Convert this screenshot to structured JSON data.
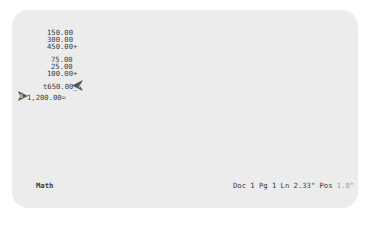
{
  "document": {
    "lines": [
      {
        "text": "150.00",
        "x": 47,
        "y": 29
      },
      {
        "text": "300.00",
        "x": 47,
        "y": 36
      },
      {
        "text": "450.00+",
        "x": 47,
        "y": 43
      },
      {
        "text": "75.00",
        "x": 51,
        "y": 56
      },
      {
        "text": "25.00",
        "x": 51,
        "y": 63
      },
      {
        "text": "100.00+",
        "x": 47,
        "y": 70
      },
      {
        "text": "t650.00_",
        "x": 43,
        "y": 83
      },
      {
        "text": "1,200.00=",
        "x": 27,
        "y": 94
      }
    ],
    "markers": [
      {
        "name": "left-pointing-arrow-icon",
        "x": 72,
        "y": 80
      },
      {
        "name": "right-pointing-arrow-icon",
        "x": 18,
        "y": 91
      }
    ]
  },
  "status_bar": {
    "mode": "Math",
    "doc_label": "Doc 1 Pg 1 Ln 2.33\" Pos",
    "pos_value": "1.8\""
  }
}
